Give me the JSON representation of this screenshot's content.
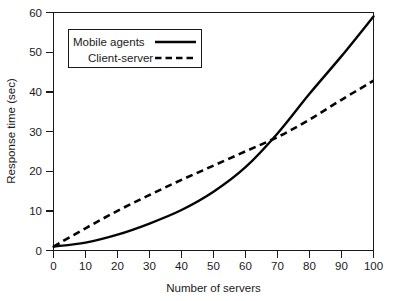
{
  "chart_data": {
    "type": "line",
    "title": "",
    "xlabel": "Number of servers",
    "ylabel": "Response time (sec)",
    "xlim": [
      0,
      100
    ],
    "ylim": [
      0,
      60
    ],
    "xticks": [
      0,
      10,
      20,
      30,
      40,
      50,
      60,
      70,
      80,
      90,
      100
    ],
    "yticks": [
      0,
      10,
      20,
      30,
      40,
      50,
      60
    ],
    "xtick_labels": [
      "0",
      "10",
      "20",
      "30",
      "40",
      "50",
      "60",
      "70",
      "80",
      "90",
      "100"
    ],
    "ytick_labels": [
      "0",
      "10",
      "20",
      "30",
      "40",
      "50",
      "60"
    ],
    "grid": false,
    "legend_position": "upper left",
    "x": [
      0,
      10,
      20,
      30,
      40,
      50,
      60,
      70,
      80,
      90,
      100
    ],
    "series": [
      {
        "name": "Mobile agents",
        "style": "solid",
        "color": "#050505",
        "values": [
          1.0,
          2.0,
          4.0,
          6.8,
          10.2,
          14.8,
          21.0,
          29.5,
          39.5,
          49.0,
          59.0
        ]
      },
      {
        "name": "Client-server",
        "style": "dashed",
        "color": "#050505",
        "values": [
          1.0,
          5.6,
          10.0,
          14.0,
          17.8,
          21.4,
          25.0,
          28.6,
          33.0,
          38.0,
          42.8
        ]
      }
    ],
    "annotations": [
      {
        "text": "crossover",
        "x": 69,
        "y": 30
      }
    ]
  },
  "legend": {
    "items": [
      {
        "label": "Mobile agents",
        "style": "solid"
      },
      {
        "label": "Client-server",
        "style": "dashed"
      }
    ]
  },
  "axes": {
    "x_title": "Number of servers",
    "y_title": "Response time (sec)"
  }
}
